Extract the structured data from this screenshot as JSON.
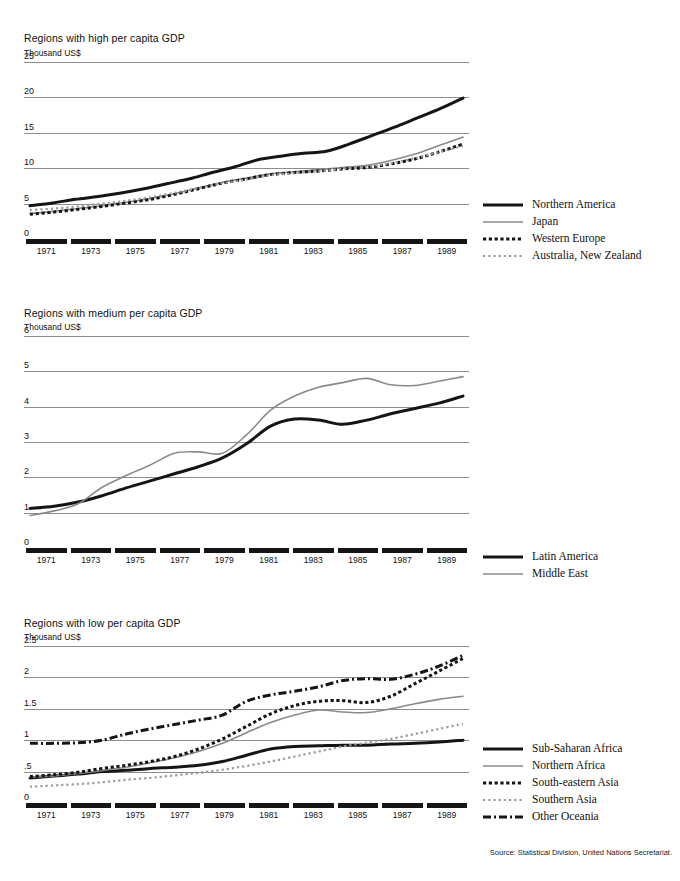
{
  "cropped_header_text": "per capita gross domestic product, 1971-1989",
  "source": "Source: Statistical Division, United Nations Secretariat.",
  "x_axis": {
    "tick_labels": [
      "1971",
      "1973",
      "1975",
      "1977",
      "1979",
      "1981",
      "1983",
      "1985",
      "1987",
      "1989"
    ],
    "years_start": 1971,
    "years_end": 1989
  },
  "panels": [
    {
      "title": "Regions with high per capita GDP",
      "unit": "Thousand US$",
      "y_ticks": [
        "25",
        "20",
        "15",
        "10",
        "5",
        "0"
      ],
      "legend": [
        {
          "label": "Northern America",
          "style": "solid-thick",
          "color": "#151515"
        },
        {
          "label": "Japan",
          "style": "solid-thin",
          "color": "#8a8a8a"
        },
        {
          "label": "Western Europe",
          "style": "dotted-thick",
          "color": "#151515"
        },
        {
          "label": "Australia, New Zealand",
          "style": "dotted-thin",
          "color": "#9a9a9a"
        }
      ]
    },
    {
      "title": "Regions with medium per capita GDP",
      "unit": "Thousand US$",
      "y_ticks": [
        "6",
        "5",
        "4",
        "3",
        "2",
        "1",
        "0"
      ],
      "legend": [
        {
          "label": "Latin America",
          "style": "solid-thick",
          "color": "#151515"
        },
        {
          "label": "Middle East",
          "style": "solid-thin",
          "color": "#8a8a8a"
        }
      ]
    },
    {
      "title": "Regions with low per capita GDP",
      "unit": "Thousand US$",
      "y_ticks": [
        "2.5",
        "2",
        "1.5",
        "1",
        ".5",
        "0"
      ],
      "legend": [
        {
          "label": "Sub-Saharan Africa",
          "style": "solid-thick",
          "color": "#151515"
        },
        {
          "label": "Northern Africa",
          "style": "solid-thin",
          "color": "#8a8a8a"
        },
        {
          "label": "South-eastern Asia",
          "style": "dotted-thick",
          "color": "#151515"
        },
        {
          "label": "Southern Asia",
          "style": "dotted-thin",
          "color": "#9a9a9a"
        },
        {
          "label": "Other Oceania",
          "style": "dashdot-thick",
          "color": "#151515"
        }
      ]
    }
  ],
  "chart_data": [
    {
      "type": "line",
      "title": "Regions with high per capita GDP",
      "xlabel": "",
      "ylabel": "Thousand US$",
      "ylim": [
        0,
        25
      ],
      "yticks": [
        0,
        5,
        10,
        15,
        20,
        25
      ],
      "grid": true,
      "legend_position": "right",
      "x": [
        1971,
        1972,
        1973,
        1974,
        1975,
        1976,
        1977,
        1978,
        1979,
        1980,
        1981,
        1982,
        1983,
        1984,
        1985,
        1986,
        1987,
        1988,
        1989
      ],
      "series": [
        {
          "name": "Northern America",
          "style": "solid-thick",
          "color": "#151515",
          "values": [
            4.7,
            5.1,
            5.6,
            6.0,
            6.5,
            7.1,
            7.8,
            8.5,
            9.4,
            10.2,
            11.2,
            11.7,
            12.1,
            12.4,
            13.4,
            14.6,
            15.8,
            17.1,
            18.4,
            19.9
          ]
        },
        {
          "name": "Japan",
          "style": "solid-thin",
          "color": "#8a8a8a",
          "values": [
            3.6,
            3.9,
            4.3,
            4.7,
            5.2,
            5.7,
            6.4,
            7.2,
            8.0,
            8.6,
            9.2,
            9.5,
            9.8,
            10.1,
            10.4,
            11.1,
            12.0,
            13.2,
            14.4
          ]
        },
        {
          "name": "Western Europe",
          "style": "dotted-thick",
          "color": "#151515",
          "values": [
            3.5,
            3.8,
            4.2,
            4.6,
            5.1,
            5.6,
            6.3,
            7.1,
            7.9,
            8.5,
            9.1,
            9.4,
            9.6,
            9.9,
            10.1,
            10.6,
            11.3,
            12.3,
            13.4
          ]
        },
        {
          "name": "Australia, New Zealand",
          "style": "dotted-thin",
          "color": "#9a9a9a",
          "values": [
            4.1,
            4.3,
            4.6,
            5.0,
            5.4,
            5.9,
            6.5,
            7.2,
            7.9,
            8.4,
            9.0,
            9.3,
            9.6,
            9.9,
            10.2,
            10.7,
            11.4,
            12.3,
            13.1
          ]
        }
      ]
    },
    {
      "type": "line",
      "title": "Regions with medium per capita GDP",
      "xlabel": "",
      "ylabel": "Thousand US$",
      "ylim": [
        0,
        6
      ],
      "yticks": [
        0,
        1,
        2,
        3,
        4,
        5,
        6
      ],
      "grid": true,
      "legend_position": "right",
      "x": [
        1971,
        1972,
        1973,
        1974,
        1975,
        1976,
        1977,
        1978,
        1979,
        1980,
        1981,
        1982,
        1983,
        1984,
        1985,
        1986,
        1987,
        1988,
        1989
      ],
      "series": [
        {
          "name": "Latin America",
          "style": "solid-thick",
          "color": "#151515",
          "values": [
            1.12,
            1.18,
            1.3,
            1.48,
            1.7,
            1.9,
            2.1,
            2.3,
            2.55,
            2.95,
            3.45,
            3.65,
            3.62,
            3.5,
            3.62,
            3.8,
            3.95,
            4.1,
            4.3
          ]
        },
        {
          "name": "Middle East",
          "style": "solid-thin",
          "color": "#8a8a8a",
          "values": [
            0.92,
            1.05,
            1.25,
            1.72,
            2.05,
            2.35,
            2.68,
            2.72,
            2.68,
            3.2,
            3.9,
            4.3,
            4.55,
            4.68,
            4.8,
            4.62,
            4.6,
            4.72,
            4.85
          ]
        }
      ]
    },
    {
      "type": "line",
      "title": "Regions with low per capita GDP",
      "xlabel": "",
      "ylabel": "Thousand US$",
      "ylim": [
        0,
        2.5
      ],
      "yticks": [
        0,
        0.5,
        1,
        1.5,
        2,
        2.5
      ],
      "grid": true,
      "legend_position": "right",
      "x": [
        1971,
        1972,
        1973,
        1974,
        1975,
        1976,
        1977,
        1978,
        1979,
        1980,
        1981,
        1982,
        1983,
        1984,
        1985,
        1986,
        1987,
        1988,
        1989
      ],
      "series": [
        {
          "name": "Sub-Saharan Africa",
          "style": "solid-thick",
          "color": "#151515",
          "values": [
            0.4,
            0.43,
            0.46,
            0.5,
            0.52,
            0.55,
            0.57,
            0.6,
            0.66,
            0.76,
            0.86,
            0.9,
            0.91,
            0.92,
            0.92,
            0.94,
            0.95,
            0.97,
            1.0
          ]
        },
        {
          "name": "Northern Africa",
          "style": "solid-thin",
          "color": "#8a8a8a",
          "values": [
            0.41,
            0.43,
            0.47,
            0.52,
            0.57,
            0.64,
            0.72,
            0.82,
            0.95,
            1.12,
            1.28,
            1.4,
            1.48,
            1.45,
            1.44,
            1.5,
            1.58,
            1.65,
            1.7
          ]
        },
        {
          "name": "South-eastern Asia",
          "style": "dotted-thick",
          "color": "#151515",
          "values": [
            0.42,
            0.45,
            0.49,
            0.55,
            0.6,
            0.66,
            0.74,
            0.86,
            1.02,
            1.22,
            1.42,
            1.55,
            1.62,
            1.63,
            1.6,
            1.7,
            1.9,
            2.1,
            2.3
          ]
        },
        {
          "name": "Southern Asia",
          "style": "dotted-thin",
          "color": "#9a9a9a",
          "values": [
            0.26,
            0.28,
            0.3,
            0.33,
            0.37,
            0.4,
            0.44,
            0.48,
            0.53,
            0.59,
            0.66,
            0.74,
            0.82,
            0.9,
            0.96,
            1.02,
            1.1,
            1.18,
            1.26
          ]
        },
        {
          "name": "Other Oceania",
          "style": "dashdot-thick",
          "color": "#151515",
          "values": [
            0.95,
            0.95,
            0.96,
            1.0,
            1.1,
            1.18,
            1.25,
            1.32,
            1.4,
            1.62,
            1.72,
            1.78,
            1.85,
            1.95,
            1.98,
            1.97,
            2.05,
            2.18,
            2.35
          ]
        }
      ]
    }
  ]
}
